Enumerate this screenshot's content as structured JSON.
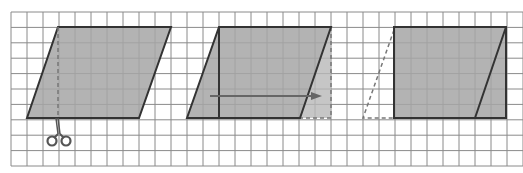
{
  "canvas": {
    "width": 523,
    "height": 173,
    "background": "#ffffff"
  },
  "grid": {
    "x0": 11,
    "y0": 12,
    "cols": 32,
    "rows": 10,
    "cell_w": 16,
    "cell_h": 15.4,
    "line_color": "#8a8a8a"
  },
  "colors": {
    "fill": "#a6a6a6",
    "fill_moved": "#b8b8b8",
    "stroke": "#333333",
    "dashed": "#777777",
    "arrow": "#666666",
    "scissors": "#555555"
  },
  "figures": [
    {
      "name": "original-parallelogram",
      "points": [
        [
          58,
          27
        ],
        [
          171,
          27
        ],
        [
          139,
          118
        ],
        [
          27,
          118
        ]
      ],
      "cut_line": {
        "x": 58,
        "y1": 27,
        "y2": 118,
        "style": "dashed"
      },
      "scissors": {
        "x": 59,
        "y": 138
      }
    },
    {
      "name": "triangle-translation",
      "points": [
        [
          219,
          27
        ],
        [
          331,
          27
        ],
        [
          300,
          118
        ],
        [
          187,
          118
        ]
      ],
      "divider": {
        "x": 219,
        "y1": 27,
        "y2": 118
      },
      "moved_triangle": [
        [
          331,
          27
        ],
        [
          331,
          118
        ],
        [
          300,
          118
        ]
      ],
      "arrow": {
        "x1": 210,
        "x2": 322,
        "y": 96
      }
    },
    {
      "name": "resulting-rectangle",
      "rect": {
        "x": 394,
        "y": 27,
        "w": 112,
        "h": 91
      },
      "diagonal": [
        [
          506,
          27
        ],
        [
          475,
          118
        ]
      ],
      "ghost_triangle": [
        [
          394,
          30
        ],
        [
          363,
          118
        ],
        [
          394,
          118
        ]
      ]
    }
  ]
}
